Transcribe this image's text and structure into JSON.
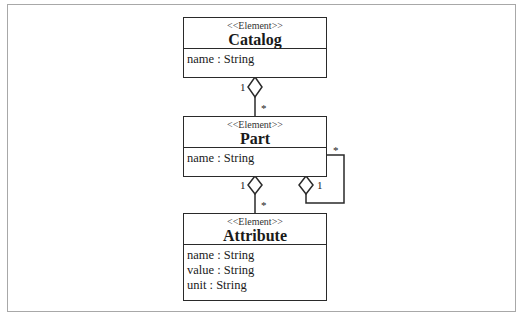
{
  "diagram": {
    "type": "UML class diagram",
    "classes": [
      {
        "id": "catalog",
        "stereotype": "<<Element>>",
        "name": "Catalog",
        "attributes": [
          "name : String"
        ]
      },
      {
        "id": "part",
        "stereotype": "<<Element>>",
        "name": "Part",
        "attributes": [
          "name : String"
        ]
      },
      {
        "id": "attribute",
        "stereotype": "<<Element>>",
        "name": "Attribute",
        "attributes": [
          "name : String",
          "value : String",
          "unit : String"
        ]
      }
    ],
    "associations": [
      {
        "from": "Catalog",
        "to": "Part",
        "kind": "aggregation",
        "from_mult": "1",
        "to_mult": "*"
      },
      {
        "from": "Part",
        "to": "Attribute",
        "kind": "aggregation",
        "from_mult": "1",
        "to_mult": "*"
      },
      {
        "from": "Part",
        "to": "Part",
        "kind": "aggregation",
        "from_mult": "1",
        "to_mult": "*"
      }
    ]
  },
  "colors": {
    "line": "#2a2a2a",
    "frame": "#a8a8a8",
    "background": "#ffffff"
  }
}
